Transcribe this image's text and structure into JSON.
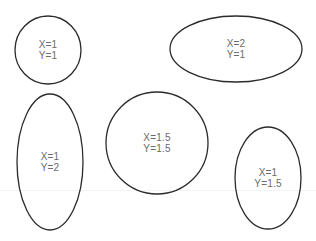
{
  "diagram": {
    "stroke_color": "#2b2b2b",
    "label_color": "#6b6b6b",
    "shapes": [
      {
        "id": "ellipse-1",
        "cx": 48,
        "cy": 50,
        "rx": 33,
        "ry": 34,
        "x_label": "X=1",
        "y_label": "Y=1"
      },
      {
        "id": "ellipse-2",
        "cx": 236,
        "cy": 49,
        "rx": 66,
        "ry": 33,
        "x_label": "X=2",
        "y_label": "Y=1"
      },
      {
        "id": "ellipse-3",
        "cx": 50,
        "cy": 162,
        "rx": 33,
        "ry": 68,
        "x_label": "X=1",
        "y_label": "Y=2"
      },
      {
        "id": "ellipse-4",
        "cx": 157,
        "cy": 143,
        "rx": 51,
        "ry": 51,
        "x_label": "X=1.5",
        "y_label": "Y=1.5"
      },
      {
        "id": "ellipse-5",
        "cx": 268,
        "cy": 178,
        "rx": 33,
        "ry": 51,
        "x_label": "X=1",
        "y_label": "Y=1.5"
      }
    ]
  }
}
